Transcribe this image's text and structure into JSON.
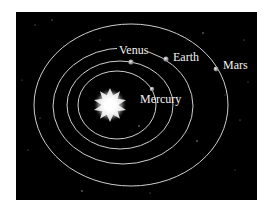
{
  "diagram": {
    "background_color": "#000000",
    "page_color": "#ffffff",
    "frame": {
      "x": 16,
      "y": 12,
      "width": 241,
      "height": 188
    },
    "sun": {
      "name": "Sun",
      "cx": 110,
      "cy": 105,
      "r": 17,
      "color": "#ffffff"
    },
    "orbit_color": "#cfcfcf",
    "planets": [
      {
        "name": "Mercury",
        "label": "Mercury",
        "orbit": {
          "cx": 117,
          "cy": 105,
          "rx": 39,
          "ry": 34
        },
        "planet": {
          "x": 152,
          "y": 89
        },
        "label_pos": {
          "x": 140,
          "y": 103
        }
      },
      {
        "name": "Venus",
        "label": "Venus",
        "orbit": {
          "cx": 120,
          "cy": 105,
          "rx": 53,
          "ry": 44
        },
        "planet": {
          "x": 131,
          "y": 62
        },
        "label_pos": {
          "x": 119,
          "y": 54
        }
      },
      {
        "name": "Earth",
        "label": "Earth",
        "orbit": {
          "cx": 123,
          "cy": 106,
          "rx": 70,
          "ry": 58
        },
        "planet": {
          "x": 166,
          "y": 59
        },
        "label_pos": {
          "x": 173,
          "y": 61
        }
      },
      {
        "name": "Mars",
        "label": "Mars",
        "orbit": {
          "cx": 131,
          "cy": 105,
          "rx": 97,
          "ry": 81
        },
        "planet": {
          "x": 216,
          "y": 69
        },
        "label_pos": {
          "x": 223,
          "y": 69
        }
      }
    ]
  }
}
